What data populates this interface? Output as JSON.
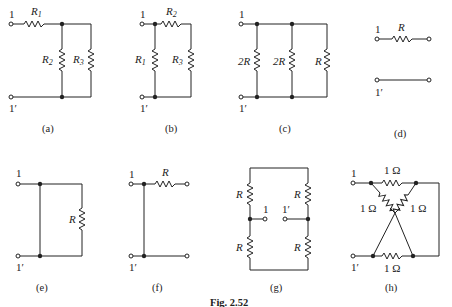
{
  "figure": {
    "caption": "Fig. 2.52",
    "panels": [
      {
        "id": "a",
        "label": "(a)",
        "terminal_top": "1",
        "terminal_bottom": "1′",
        "resistors": [
          "R1",
          "R2",
          "R3"
        ],
        "topology": "R1 series, then R2 parallel R3"
      },
      {
        "id": "b",
        "label": "(b)",
        "terminal_top": "1",
        "terminal_bottom": "1′",
        "resistors": [
          "R1",
          "R2",
          "R3"
        ],
        "topology": "R1 across terminals, parallel with R2 series R3"
      },
      {
        "id": "c",
        "label": "(c)",
        "terminal_top": "1",
        "terminal_bottom": "1′",
        "resistors": [
          "2R",
          "2R",
          "R"
        ],
        "topology": "three resistors in parallel"
      },
      {
        "id": "d",
        "label": "(d)",
        "terminal_top": "1",
        "terminal_bottom": "1′",
        "resistors": [
          "R"
        ],
        "topology": "series R on top line, bottom line through"
      },
      {
        "id": "e",
        "label": "(e)",
        "terminal_top": "1",
        "terminal_bottom": "1′",
        "resistors": [
          "R"
        ],
        "topology": "short across terminals, R in parallel"
      },
      {
        "id": "f",
        "label": "(f)",
        "terminal_top": "1",
        "terminal_bottom": "1′",
        "resistors": [
          "R"
        ],
        "topology": "short between terminals, series R to open output"
      },
      {
        "id": "g",
        "label": "(g)",
        "terminal_top": "1",
        "terminal_bottom": "1′",
        "resistors": [
          "R",
          "R",
          "R",
          "R"
        ],
        "topology": "bridge with terminals at midpoints"
      },
      {
        "id": "h",
        "label": "(h)",
        "terminal_top": "1",
        "terminal_bottom": "1′",
        "resistors": [
          "1 Ω",
          "1 Ω",
          "1 Ω",
          "1 Ω"
        ],
        "topology": "lattice with crossed wires"
      }
    ]
  },
  "labels": {
    "t1": "1",
    "t1p": "1′",
    "R": "R",
    "R1": "R",
    "R1s": "1",
    "R2": "R",
    "R2s": "2",
    "R3": "R",
    "R3s": "3",
    "twoR": "2R",
    "ohm": "1 Ω",
    "a": "(a)",
    "b": "(b)",
    "c": "(c)",
    "d": "(d)",
    "e": "(e)",
    "f": "(f)",
    "g": "(g)",
    "h": "(h)",
    "caption": "Fig. 2.52"
  }
}
